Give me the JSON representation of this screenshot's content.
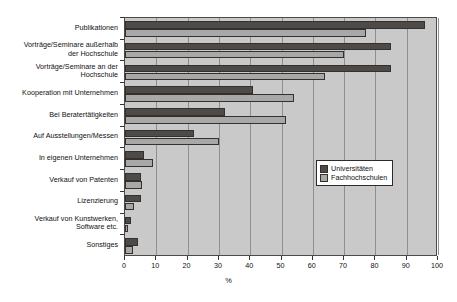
{
  "chart_data": {
    "type": "bar",
    "orientation": "horizontal",
    "title": "",
    "xlabel": "%",
    "ylabel": "",
    "xlim": [
      0,
      100
    ],
    "xticks": [
      0,
      10,
      20,
      30,
      40,
      50,
      60,
      70,
      80,
      90,
      100
    ],
    "xtick_labels": [
      "0",
      "10",
      "20",
      "30",
      "40",
      "50",
      "60",
      "70",
      "80",
      "90",
      "100"
    ],
    "grid": true,
    "legend_position": "center-right",
    "categories": [
      "Publikationen",
      "Vorträge/Seminare außerhalb\nder Hochschule",
      "Vorträge/Seminare an der\nHochschule",
      "Kooperation mit Unternehmen",
      "Bei Beratertätigkeiten",
      "Auf Ausstellungen/Messen",
      "In eigenen Unternehmen",
      "Verkauf von Patenten",
      "Lizenzierung",
      "Verkauf von Kunstwerken,\nSoftware etc.",
      "Sonstiges"
    ],
    "series": [
      {
        "name": "Universitäten",
        "color": "#4d4a48",
        "values": [
          96,
          85,
          85,
          41,
          32,
          22,
          6,
          5,
          5,
          2,
          4
        ]
      },
      {
        "name": "Fachhochschulen",
        "color": "#a8a8a8",
        "values": [
          77,
          70,
          64,
          54,
          51.5,
          30,
          9,
          5.5,
          3,
          1,
          2.5
        ]
      }
    ]
  },
  "legend": {
    "items": [
      {
        "label": "Universitäten",
        "swatch": "dark-swatch"
      },
      {
        "label": "Fachhochschulen",
        "swatch": "light-swatch"
      }
    ]
  },
  "axis": {
    "x_title": "%"
  }
}
